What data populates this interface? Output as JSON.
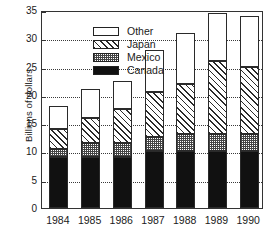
{
  "chart_data": {
    "type": "bar",
    "subtype": "stacked-vertical",
    "title": "",
    "xlabel": "",
    "ylabel": "Billions of dollars",
    "categories": [
      "1984",
      "1985",
      "1986",
      "1987",
      "1988",
      "1989",
      "1990"
    ],
    "series": [
      {
        "name": "Canada",
        "values": [
          9,
          9,
          9,
          10,
          10,
          10,
          10
        ],
        "fill": "solid-black",
        "color": "#111111"
      },
      {
        "name": "Mexico",
        "values": [
          1.5,
          2.5,
          2.5,
          2.5,
          3,
          3,
          3
        ],
        "fill": "stippled-gray",
        "color": "#808080"
      },
      {
        "name": "Japan",
        "values": [
          3.5,
          4.5,
          6,
          8,
          9,
          13,
          12
        ],
        "fill": "diagonal-hatch",
        "color": "#2a2a2a"
      },
      {
        "name": "Other",
        "values": [
          4,
          5,
          5,
          7.5,
          9,
          8.5,
          9
        ],
        "fill": "white",
        "color": "#ffffff"
      }
    ],
    "totals": [
      18,
      21,
      22.5,
      28,
      31,
      34.5,
      34
    ],
    "ylim": [
      0,
      35
    ],
    "yticks": [
      0,
      5,
      10,
      15,
      20,
      25,
      30,
      35
    ],
    "ytick_labels": [
      "0",
      "5",
      "10",
      "15",
      "20",
      "25",
      "30",
      "35"
    ],
    "grid": "horizontal-dotted",
    "legend_position": "top-left-inside",
    "legend_order": [
      "Other",
      "Japan",
      "Mexico",
      "Canada"
    ]
  },
  "legend": {
    "items": [
      {
        "label": "Other",
        "swatch": "white-swatch"
      },
      {
        "label": "Japan",
        "swatch": "hatched-swatch"
      },
      {
        "label": "Mexico",
        "swatch": "stippled-swatch"
      },
      {
        "label": "Canada",
        "swatch": "black-swatch"
      }
    ]
  },
  "axes": {
    "y_title": "Billions of dollars"
  }
}
